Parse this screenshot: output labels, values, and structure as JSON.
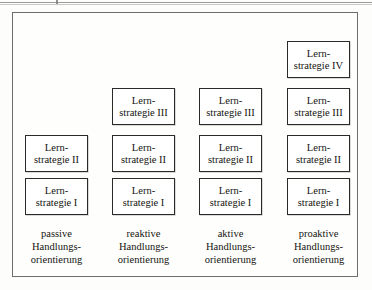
{
  "figure": {
    "type": "staircase-matrix-diagram",
    "frame_color": "#6e6e6a",
    "box_border_color": "#2a2a28",
    "text_color": "#14140f",
    "background": "#fefefd",
    "box_geometry": {
      "width": 63,
      "height": 37,
      "row_gap": 14,
      "col_pitch": 87
    },
    "row_tops": [
      178,
      135,
      88,
      41
    ],
    "column_lefts": [
      25,
      112,
      199,
      287
    ]
  },
  "columns": [
    {
      "id": "passive",
      "label": {
        "line1": "passive",
        "line2": "Handlungs-",
        "line3": "orientierung"
      },
      "label_left": 0,
      "boxes": [
        {
          "level": "I",
          "line1": "Lern-",
          "line2": "strategie I",
          "row": 0
        },
        {
          "level": "II",
          "line1": "Lern-",
          "line2": "strategie II",
          "row": 1
        }
      ]
    },
    {
      "id": "reaktive",
      "label": {
        "line1": "reaktive",
        "line2": "Handlungs-",
        "line3": "orientierung"
      },
      "label_left": 1,
      "boxes": [
        {
          "level": "I",
          "line1": "Lern-",
          "line2": "strategie I",
          "row": 0
        },
        {
          "level": "II",
          "line1": "Lern-",
          "line2": "strategie II",
          "row": 1
        },
        {
          "level": "III",
          "line1": "Lern-",
          "line2": "strategie III",
          "row": 2
        }
      ]
    },
    {
      "id": "aktive",
      "label": {
        "line1": "aktive",
        "line2": "Handlungs-",
        "line3": "orientierung"
      },
      "label_left": 2,
      "boxes": [
        {
          "level": "I",
          "line1": "Lern-",
          "line2": "strategie I",
          "row": 0
        },
        {
          "level": "II",
          "line1": "Lern-",
          "line2": "strategie II",
          "row": 1
        },
        {
          "level": "III",
          "line1": "Lern-",
          "line2": "strategie III",
          "row": 2
        }
      ]
    },
    {
      "id": "proaktive",
      "label": {
        "line1": "proaktive",
        "line2": "Handlungs-",
        "line3": "orientierung"
      },
      "label_left": 3,
      "boxes": [
        {
          "level": "I",
          "line1": "Lern-",
          "line2": "strategie I",
          "row": 0
        },
        {
          "level": "II",
          "line1": "Lern-",
          "line2": "strategie II",
          "row": 1
        },
        {
          "level": "III",
          "line1": "Lern-",
          "line2": "strategie III",
          "row": 2
        },
        {
          "level": "IV",
          "line1": "Lern-",
          "line2": "strategie IV",
          "row": 3
        }
      ]
    }
  ],
  "labels_top": 228
}
